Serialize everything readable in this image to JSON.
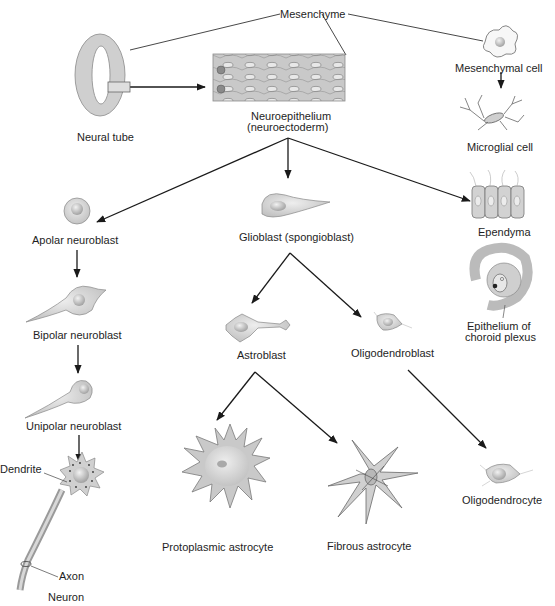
{
  "diagram": {
    "labels": {
      "mesenchyme": "Mesenchyme",
      "mesenchymal_cell": "Mesenchymal cell",
      "microglial_cell": "Microglial cell",
      "neural_tube": "Neural tube",
      "neuroepithelium_1": "Neuroepithelium",
      "neuroepithelium_2": "(neuroectoderm)",
      "apolar_neuroblast": "Apolar neuroblast",
      "glioblast": "Glioblast (spongioblast)",
      "ependyma": "Ependyma",
      "choroid_1": "Epithelium of",
      "choroid_2": "choroid plexus",
      "bipolar_neuroblast": "Bipolar neuroblast",
      "astroblast": "Astroblast",
      "oligodendroblast": "Oligodendroblast",
      "unipolar_neuroblast": "Unipolar neuroblast",
      "dendrite": "Dendrite",
      "axon": "Axon",
      "neuron": "Neuron",
      "protoplasmic_astrocyte": "Protoplasmic astrocyte",
      "fibrous_astrocyte": "Fibrous astrocyte",
      "oligodendrocyte": "Oligodendrocyte"
    },
    "nodes": [
      {
        "id": "neural_tube",
        "label": "Neural tube"
      },
      {
        "id": "neuroepithelium",
        "label": "Neuroepithelium (neuroectoderm)"
      },
      {
        "id": "mesenchyme",
        "label": "Mesenchyme"
      },
      {
        "id": "mesenchymal_cell",
        "label": "Mesenchymal cell"
      },
      {
        "id": "microglial_cell",
        "label": "Microglial cell"
      },
      {
        "id": "apolar_neuroblast",
        "label": "Apolar neuroblast"
      },
      {
        "id": "bipolar_neuroblast",
        "label": "Bipolar neuroblast"
      },
      {
        "id": "unipolar_neuroblast",
        "label": "Unipolar neuroblast"
      },
      {
        "id": "neuron",
        "label": "Neuron"
      },
      {
        "id": "glioblast",
        "label": "Glioblast (spongioblast)"
      },
      {
        "id": "astroblast",
        "label": "Astroblast"
      },
      {
        "id": "oligodendroblast",
        "label": "Oligodendroblast"
      },
      {
        "id": "protoplasmic_astrocyte",
        "label": "Protoplasmic astrocyte"
      },
      {
        "id": "fibrous_astrocyte",
        "label": "Fibrous astrocyte"
      },
      {
        "id": "oligodendrocyte",
        "label": "Oligodendrocyte"
      },
      {
        "id": "ependyma",
        "label": "Ependyma"
      },
      {
        "id": "choroid_plexus",
        "label": "Epithelium of choroid plexus"
      }
    ],
    "edges": [
      {
        "from": "neural_tube",
        "to": "neuroepithelium"
      },
      {
        "from": "mesenchymal_cell",
        "to": "microglial_cell"
      },
      {
        "from": "neuroepithelium",
        "to": "apolar_neuroblast"
      },
      {
        "from": "neuroepithelium",
        "to": "glioblast"
      },
      {
        "from": "neuroepithelium",
        "to": "ependyma"
      },
      {
        "from": "apolar_neuroblast",
        "to": "bipolar_neuroblast"
      },
      {
        "from": "bipolar_neuroblast",
        "to": "unipolar_neuroblast"
      },
      {
        "from": "unipolar_neuroblast",
        "to": "neuron"
      },
      {
        "from": "glioblast",
        "to": "astroblast"
      },
      {
        "from": "glioblast",
        "to": "oligodendroblast"
      },
      {
        "from": "astroblast",
        "to": "protoplasmic_astrocyte"
      },
      {
        "from": "astroblast",
        "to": "fibrous_astrocyte"
      },
      {
        "from": "oligodendroblast",
        "to": "oligodendrocyte"
      }
    ],
    "colors": {
      "cell_fill": "#d4d4d4",
      "cell_stroke": "#6e6e6e",
      "nucleus": "#b5b5b5",
      "line": "#1a1a1a"
    }
  }
}
